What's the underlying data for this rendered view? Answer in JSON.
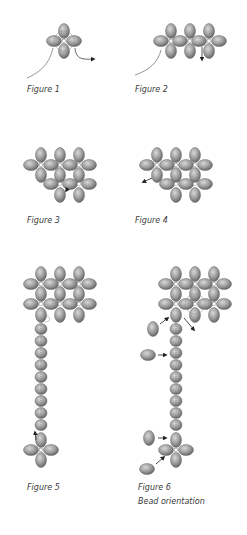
{
  "figures": [
    {
      "id": "figure-1",
      "label": "Figure 1",
      "label_pos": [
        27,
        85
      ]
    },
    {
      "id": "figure-2",
      "label": "Figure 2",
      "label_pos": [
        135,
        85
      ]
    },
    {
      "id": "figure-3",
      "label": "Figure 3",
      "label_pos": [
        27,
        216
      ]
    },
    {
      "id": "figure-4",
      "label": "Figure 4",
      "label_pos": [
        135,
        216
      ]
    },
    {
      "id": "figure-5",
      "label": "Figure 5",
      "label_pos": [
        27,
        483
      ]
    },
    {
      "id": "figure-6",
      "label": "Figure 6",
      "sublabel": "Bead orientation",
      "label_pos": [
        138,
        483
      ]
    }
  ],
  "colors": {
    "bead_light": "#c8c8c8",
    "bead_mid": "#9a9a9a",
    "bead_dark": "#6a6a6a",
    "thread": "#7a7a7a",
    "arrow": "#222222",
    "caption": "#3a3a3a",
    "background": "#ffffff"
  }
}
